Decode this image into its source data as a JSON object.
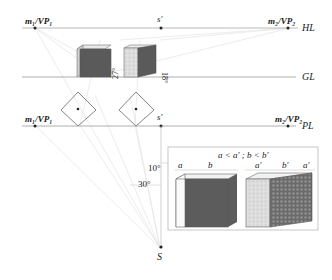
{
  "labels": {
    "hl_left": "m₁/VP₁",
    "hl_center": "s′",
    "hl_right": "m₂/VP₂",
    "hl_line": "HL",
    "gl_line": "GL",
    "pl_left": "m₁/VP₁",
    "pl_center": "s′",
    "pl_right": "m₂/VP₂",
    "pl_line": "PL",
    "station_point": "S",
    "angle_27": "27°",
    "angle_18": "18°",
    "angle_10": "10°",
    "angle_30": "30°"
  },
  "inset": {
    "caption": "a < a′  ;  b < b′",
    "left_box": {
      "dim_a": "a",
      "dim_b": "b"
    },
    "right_box": {
      "dim_a1": "a′",
      "dim_b": "b′",
      "dim_a2": "a′"
    }
  },
  "colors": {
    "line": "#9a9a9a",
    "construction": "#e2e2e2",
    "dark_face": "#555555",
    "light_face": "#d9d9d9"
  }
}
